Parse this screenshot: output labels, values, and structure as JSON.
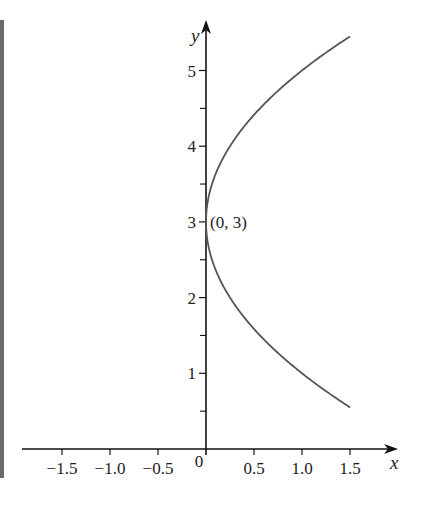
{
  "chart_data": {
    "type": "line",
    "title": "",
    "xlabel": "x",
    "ylabel": "y",
    "xlim": [
      -1.9,
      1.9
    ],
    "ylim": [
      0,
      5.6
    ],
    "grid": false,
    "legend": null,
    "x_ticks": [
      -1.5,
      -1.0,
      -0.5,
      0,
      0.5,
      1.0,
      1.5
    ],
    "x_tick_labels": [
      "−1.5",
      "−1.0",
      "−0.5",
      "0",
      "0.5",
      "1.0",
      "1.5"
    ],
    "y_ticks": [
      1,
      2,
      3,
      4,
      5
    ],
    "y_tick_labels": [
      "1",
      "2",
      "3",
      "4",
      "5"
    ],
    "y_minor_ticks": [
      0.5,
      1.5,
      2.5,
      3.5,
      4.5
    ],
    "series": [
      {
        "name": "parabola x = (y - 3)^2 / 4",
        "x": [
          1.5,
          1.2,
          0.9,
          0.6,
          0.4,
          0.2,
          0.1,
          0.04,
          0.01,
          0,
          0.01,
          0.04,
          0.1,
          0.2,
          0.4,
          0.6,
          0.9,
          1.2,
          1.5
        ],
        "y": [
          0.55,
          0.81,
          1.1,
          1.45,
          1.74,
          2.11,
          2.37,
          2.6,
          2.8,
          3.0,
          3.2,
          3.4,
          3.63,
          3.89,
          4.26,
          4.55,
          4.9,
          5.19,
          5.45
        ]
      }
    ],
    "annotations": [
      {
        "text": "(0, 3)",
        "x": 0,
        "y": 3
      }
    ]
  }
}
